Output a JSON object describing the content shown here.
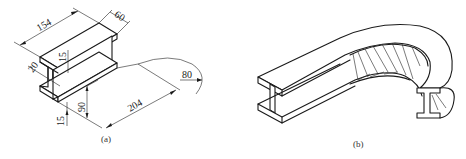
{
  "figure_a": {
    "caption": "(a)",
    "dimensions": {
      "length_top": "154",
      "flange_width": "60",
      "flange_thickness_top": "15",
      "web_thickness": "20",
      "height": "90",
      "flange_thickness_bottom": "15",
      "bend_length": "204",
      "bend_radius": "80"
    }
  },
  "figure_b": {
    "caption": "(b)"
  },
  "top_cropped_text": "· · · · · ·"
}
